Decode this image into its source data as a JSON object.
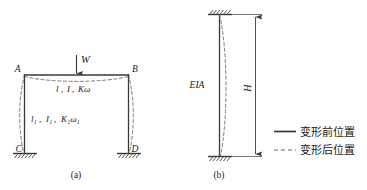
{
  "figure": {
    "background_color": "#ffffff",
    "line_color": "#3a3a3a",
    "dashed_color": "#6e6e6e",
    "text_color": "#1a1a1a"
  },
  "panel_a": {
    "caption": "(a)",
    "load_label": "W",
    "node_labels": {
      "top_left": "A",
      "top_right": "B",
      "bottom_left": "C",
      "bottom_right": "D"
    },
    "beam_property_label": "l, I, Kω",
    "beam_property_parts": {
      "length": "l",
      "inertia": "I",
      "stiffness": "Kω"
    },
    "column_property_label": "l₁, I₁, K₁ω₁",
    "column_property_parts": {
      "length": "l₁",
      "inertia": "I₁",
      "stiffness": "K₁ω₁"
    }
  },
  "panel_b": {
    "caption": "(b)",
    "member_property_label": "EIA",
    "height_label": "H"
  },
  "legend": {
    "items": [
      {
        "label": "变形前位置",
        "style": "solid"
      },
      {
        "label": "变形后位置",
        "style": "dashed"
      }
    ]
  }
}
